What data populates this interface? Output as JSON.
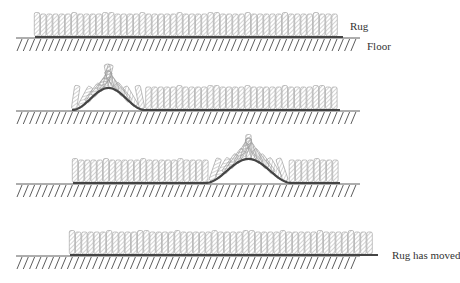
{
  "labels": {
    "rug": "Rug",
    "floor": "Floor",
    "moved": "Rug has moved"
  },
  "colors": {
    "fiber": "#9a9a9a",
    "backing": "#444444",
    "floor": "#333333"
  },
  "panels": [
    {
      "id": 1,
      "description": "Rug flat on floor",
      "floor_y": 38,
      "rug_start": 35,
      "rug_end": 343,
      "bump": null
    },
    {
      "id": 2,
      "description": "Ruck formed at left end",
      "floor_y": 111,
      "rug_start": 72,
      "rug_end": 340,
      "bump": {
        "start": 72,
        "end": 145,
        "peak_height": 22
      }
    },
    {
      "id": 3,
      "description": "Ruck propagated toward right",
      "floor_y": 184,
      "rug_start": 73,
      "rug_end": 340,
      "bump": {
        "start": 205,
        "end": 292,
        "peak_height": 24
      }
    },
    {
      "id": 4,
      "description": "Rug displaced to the right",
      "floor_y": 256,
      "rug_start": 70,
      "rug_end": 378,
      "bump": null
    }
  ]
}
